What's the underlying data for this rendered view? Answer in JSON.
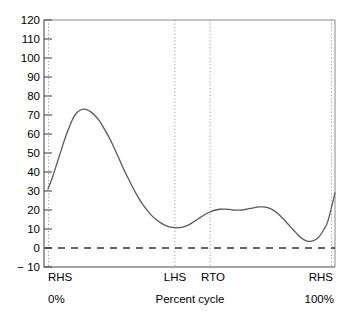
{
  "chart_data": {
    "type": "line",
    "title": "",
    "subtitle": "",
    "xlabel": "Percent cycle",
    "ylabel": "",
    "xlim": [
      0,
      100
    ],
    "ylim": [
      -10,
      120
    ],
    "grid": false,
    "legend": null,
    "y_ticks": [
      120,
      110,
      100,
      90,
      80,
      70,
      60,
      50,
      40,
      30,
      20,
      10,
      0,
      -10
    ],
    "y_tick_labels": [
      "120",
      "110",
      "100",
      "90",
      "80",
      "70",
      "60",
      "50",
      "40",
      "30",
      "20",
      "10",
      "0",
      "− 10"
    ],
    "x_event_markers": [
      {
        "label": "RHS",
        "percent": 0
      },
      {
        "label": "LHS",
        "percent": 44.2
      },
      {
        "label": "RTO",
        "percent": 56.5
      },
      {
        "label": "RHS",
        "percent": 100
      }
    ],
    "x_range_labels": {
      "start": "0%",
      "end": "100%"
    },
    "zero_reference_line": {
      "value": 0,
      "style": "dashed"
    },
    "series": [
      {
        "name": "",
        "style": "solid",
        "x": [
          0,
          2,
          4,
          6,
          8,
          10,
          12,
          14,
          16,
          18,
          20,
          22,
          24,
          26,
          28,
          30,
          32,
          34,
          36,
          38,
          40,
          42,
          44,
          46,
          48,
          50,
          52,
          54,
          56,
          58,
          60,
          62,
          64,
          66,
          68,
          70,
          72,
          74,
          76,
          78,
          80,
          82,
          84,
          86,
          88,
          90,
          92,
          94,
          96,
          98,
          100
        ],
        "values": [
          31,
          39,
          48,
          56,
          63,
          69,
          72,
          73,
          72.5,
          70.5,
          67.5,
          63.5,
          58.5,
          52.5,
          46,
          40,
          34.5,
          29.5,
          25,
          21,
          17.5,
          14.5,
          12.5,
          11.2,
          10.6,
          10.7,
          11.5,
          13,
          14.8,
          16.5,
          18,
          19.3,
          20.2,
          20.6,
          20.6,
          20.2,
          19.9,
          19.9,
          20.2,
          20.7,
          21.2,
          21.5,
          21.5,
          21,
          19.5,
          17,
          14,
          11,
          8,
          5.5,
          4
        ],
        "values_tail_note": "curve dips to minimum ~3.5 near 86% then rises to 29 at 100%"
      }
    ],
    "series_full": [
      {
        "name": "ground-reaction-curve",
        "x": [
          0,
          1.5,
          3,
          4.5,
          6,
          7.5,
          9,
          10.5,
          12,
          13.5,
          15,
          16.5,
          18,
          19.5,
          21,
          22.5,
          24,
          25.5,
          27,
          28.5,
          30,
          31.5,
          33,
          34.5,
          36,
          37.5,
          39,
          40.5,
          42,
          43.5,
          45,
          46.5,
          48,
          49.5,
          51,
          52.5,
          54,
          55.5,
          57,
          58.5,
          60,
          61.5,
          63,
          64.5,
          66,
          67.5,
          69,
          70.5,
          72,
          73.5,
          75,
          76.5,
          78,
          79.5,
          81,
          82.5,
          84,
          85.5,
          87,
          88.5,
          90,
          91.5,
          93,
          94.5,
          96,
          97.5,
          100
        ],
        "y": [
          31,
          37,
          44,
          51,
          58,
          64,
          69,
          71.8,
          73,
          72.8,
          71.5,
          69.5,
          66.8,
          63,
          59,
          54.5,
          49.5,
          44.5,
          39.5,
          35,
          30.5,
          26.5,
          23,
          20,
          17.3,
          15.2,
          13.5,
          12.2,
          11.3,
          10.8,
          10.6,
          10.8,
          11.5,
          12.6,
          14,
          15.5,
          17,
          18.3,
          19.3,
          20,
          20.4,
          20.5,
          20.3,
          20,
          19.9,
          20,
          20.4,
          20.8,
          21.3,
          21.6,
          21.6,
          21.2,
          20.3,
          18.8,
          16.8,
          14.5,
          12,
          9.5,
          7,
          5,
          3.8,
          3.5,
          4.2,
          6,
          9.5,
          14,
          29
        ]
      }
    ]
  },
  "axis": {
    "y_label_minus_ten": "− 10"
  }
}
